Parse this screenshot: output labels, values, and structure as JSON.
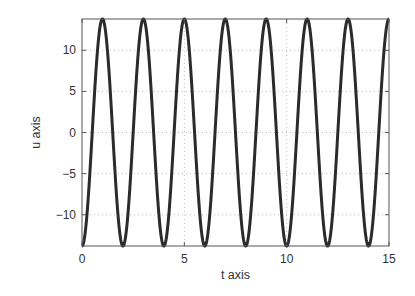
{
  "chart_data": {
    "type": "line",
    "title": "",
    "xlabel": "t axis",
    "ylabel": "u axis",
    "xlim": [
      0,
      15
    ],
    "ylim": [
      -13.8,
      13.8
    ],
    "xticks": [
      0,
      5,
      10,
      15
    ],
    "xtick_labels": [
      "0",
      "5",
      "10",
      "15"
    ],
    "yticks": [
      -10,
      -5,
      0,
      5,
      10
    ],
    "ytick_labels": [
      "−10",
      "−5",
      "0",
      "5",
      "10"
    ],
    "grid": true,
    "grid_style": "dotted",
    "legend": null,
    "series": [
      {
        "name": "u(t)",
        "function": "u = -13.8 * cos(pi * t)",
        "amplitude": 13.8,
        "period": 2,
        "color": "#2b2b2b",
        "x": [
          0,
          1,
          2,
          3,
          4,
          5,
          6,
          7,
          8,
          9,
          10,
          11,
          12,
          13,
          14,
          15
        ],
        "values": [
          -13.8,
          13.8,
          -13.8,
          13.8,
          -13.8,
          13.8,
          -13.8,
          13.8,
          -13.8,
          13.8,
          -13.8,
          13.8,
          -13.8,
          13.8,
          -13.8,
          13.8
        ]
      }
    ]
  },
  "colors": {
    "line": "#2b2b2b",
    "axes": "#555555",
    "grid": "#bbbbbb",
    "text": "#333333"
  }
}
